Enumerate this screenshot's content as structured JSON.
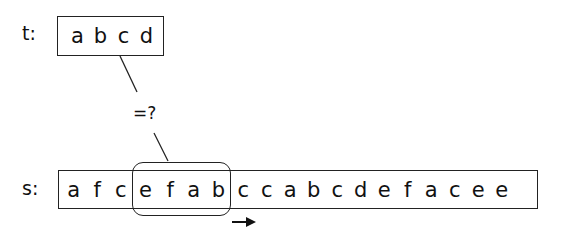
{
  "pattern": {
    "label": "t:",
    "chars": [
      "a",
      "b",
      "c",
      "d"
    ]
  },
  "text": {
    "label": "s:",
    "chars": [
      "a",
      "f",
      "c",
      "e",
      "f",
      "a",
      "b",
      "c",
      "c",
      "a",
      "b",
      "c",
      "d",
      "e",
      "f",
      "a",
      "c",
      "e",
      "e"
    ]
  },
  "comparison": {
    "label": "=?",
    "window_start_index": 3,
    "window_length": 4
  },
  "shift_arrow": {
    "direction": "right",
    "icon": "arrow-right-icon"
  },
  "colors": {
    "stroke": "#222222",
    "background": "#ffffff"
  }
}
